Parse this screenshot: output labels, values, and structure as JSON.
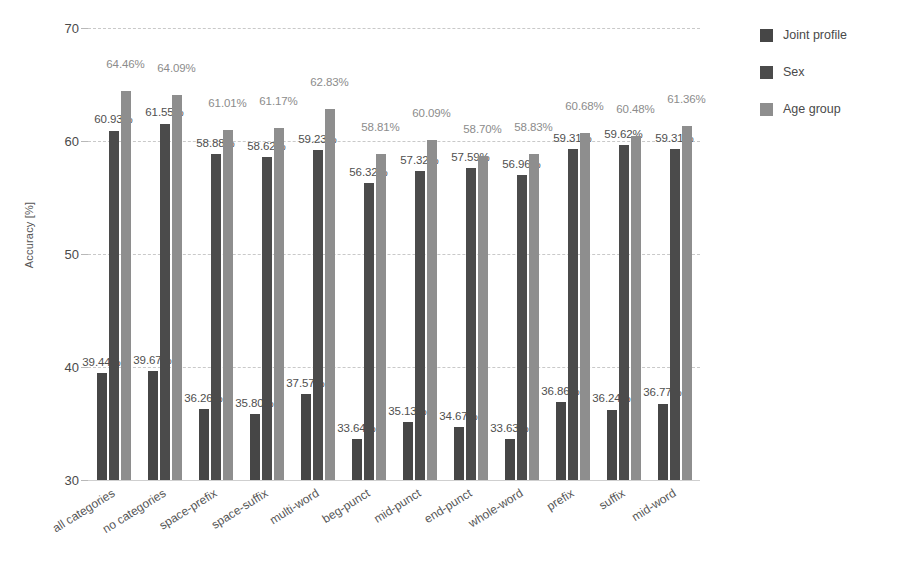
{
  "chart_data": {
    "type": "bar",
    "title": "",
    "xlabel": "",
    "ylabel": "Accuracy [%]",
    "ylim": [
      30,
      70
    ],
    "yticks": [
      30,
      40,
      50,
      60,
      70
    ],
    "grid": true,
    "legend_position": "right",
    "value_suffix": "%",
    "categories": [
      "all categories",
      "no categories",
      "space-prefix",
      "space-suffix",
      "multi-word",
      "beg-punct",
      "mid-punct",
      "end-punct",
      "whole-word",
      "prefix",
      "suffix",
      "mid-word"
    ],
    "series": [
      {
        "name": "Joint profile",
        "color": "#464646",
        "values": [
          39.44,
          39.67,
          36.26,
          35.8,
          37.57,
          33.64,
          35.13,
          34.67,
          33.63,
          36.86,
          36.24,
          36.77
        ],
        "labels": [
          "39.44%",
          "39.67%",
          "36.26%",
          "35.80%",
          "37.57%",
          "33.64%",
          "35.13%",
          "34.67%",
          "33.63%",
          "36.86%",
          "36.24%",
          "36.77%"
        ]
      },
      {
        "name": "Sex",
        "color": "#4b4b4b",
        "values": [
          60.93,
          61.55,
          58.88,
          58.62,
          59.23,
          56.32,
          57.32,
          57.59,
          56.96,
          59.31,
          59.62,
          59.31
        ],
        "labels": [
          "60.93%",
          "61.55%",
          "58.88%",
          "58.62%",
          "59.23%",
          "56.32%",
          "57.32%",
          "57.59%",
          "56.96%",
          "59.31%",
          "59.62%",
          "59.31%"
        ]
      },
      {
        "name": "Age group",
        "color": "#8e8e8e",
        "values": [
          64.46,
          64.09,
          61.01,
          61.17,
          62.83,
          58.81,
          60.09,
          58.7,
          58.83,
          60.68,
          60.48,
          61.36
        ],
        "labels": [
          "64.46%",
          "64.09%",
          "61.01%",
          "61.17%",
          "62.83%",
          "58.81%",
          "60.09%",
          "58.70%",
          "58.83%",
          "60.68%",
          "60.48%",
          "61.36%"
        ]
      }
    ]
  },
  "legend": {
    "items": [
      {
        "label": "Joint profile",
        "color": "#464646"
      },
      {
        "label": "Sex",
        "color": "#4b4b4b"
      },
      {
        "label": "Age group",
        "color": "#8e8e8e"
      }
    ]
  }
}
